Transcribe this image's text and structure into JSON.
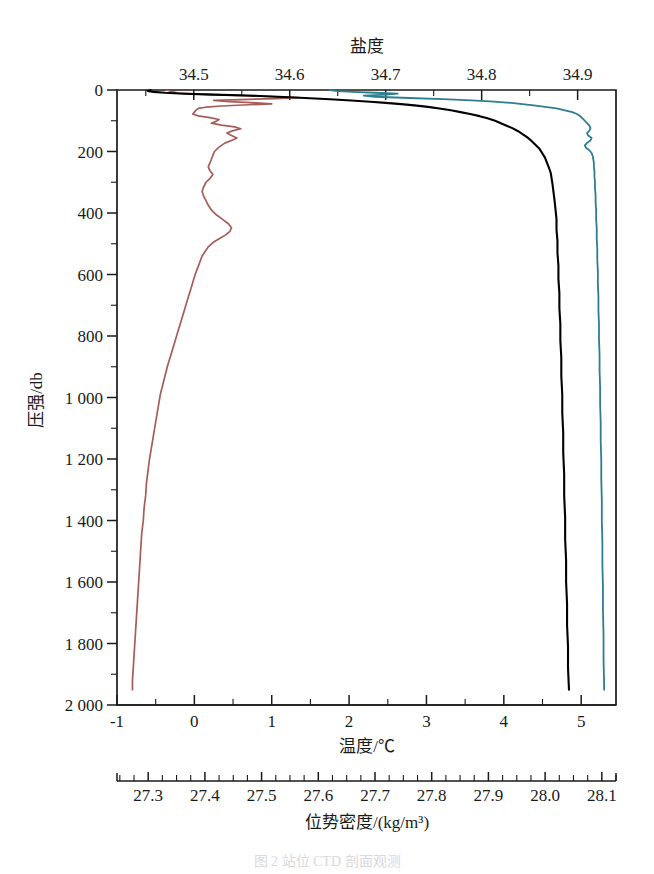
{
  "figure": {
    "caption": "图 2 站位 CTD 剖面观测",
    "background": "#ffffff"
  },
  "chart_data": {
    "type": "line",
    "title": "",
    "orientation": "vertical-profile",
    "grid": false,
    "legend_position": "none",
    "yaxis": {
      "label": "压强/db",
      "ticks": [
        0,
        200,
        400,
        600,
        800,
        1000,
        1200,
        1400,
        1600,
        1800,
        2000
      ],
      "ticklabels": [
        "0",
        "200",
        "400",
        "600",
        "800",
        "1 000",
        "1 200",
        "1 400",
        "1 600",
        "1 800",
        "2 000"
      ],
      "minor_step": 100,
      "range": [
        0,
        2000
      ],
      "inverted": true
    },
    "axes_x": [
      {
        "name": "salinity",
        "position": "top",
        "label": "盐度",
        "ticks": [
          34.5,
          34.6,
          34.7,
          34.8,
          34.9
        ],
        "ticklabels": [
          "34.5",
          "34.6",
          "34.7",
          "34.8",
          "34.9"
        ],
        "minor_step": 0.05,
        "range": [
          34.42,
          34.94
        ],
        "color": "#000000"
      },
      {
        "name": "temperature",
        "position": "bottom",
        "label": "温度/℃",
        "ticks": [
          -1,
          0,
          1,
          2,
          3,
          4,
          5
        ],
        "ticklabels": [
          "-1",
          "0",
          "1",
          "2",
          "3",
          "4",
          "5"
        ],
        "minor_step": 0.5,
        "range": [
          -1.0,
          5.45
        ],
        "color": "#a65d59"
      },
      {
        "name": "potential_density",
        "position": "below-bottom",
        "label": "位势密度/(kg/m³)",
        "ticks": [
          27.3,
          27.4,
          27.5,
          27.6,
          27.7,
          27.8,
          27.9,
          28.0,
          28.1
        ],
        "ticklabels": [
          "27.3",
          "27.4",
          "27.5",
          "27.6",
          "27.7",
          "27.8",
          "27.9",
          "28.0",
          "28.1"
        ],
        "minor_step": 0.025,
        "range": [
          27.245,
          28.125
        ],
        "color": "#2d7f8f"
      }
    ],
    "series": [
      {
        "name": "温度",
        "axis": "temperature",
        "color": "#a65d59",
        "width": 1.7,
        "unit": "℃",
        "points": [
          [
            -0.35,
            0
          ],
          [
            -0.3,
            5
          ],
          [
            -0.2,
            10
          ],
          [
            0.15,
            14
          ],
          [
            0.6,
            18
          ],
          [
            1.05,
            22
          ],
          [
            1.35,
            25
          ],
          [
            1.05,
            28
          ],
          [
            0.6,
            31
          ],
          [
            0.25,
            34
          ],
          [
            0.45,
            38
          ],
          [
            0.8,
            42
          ],
          [
            1.0,
            45
          ],
          [
            0.7,
            48
          ],
          [
            0.35,
            52
          ],
          [
            0.15,
            56
          ],
          [
            0.05,
            60
          ],
          [
            0.02,
            66
          ],
          [
            0.0,
            72
          ],
          [
            -0.02,
            78
          ],
          [
            0.05,
            84
          ],
          [
            0.2,
            90
          ],
          [
            0.32,
            96
          ],
          [
            0.28,
            102
          ],
          [
            0.22,
            108
          ],
          [
            0.35,
            114
          ],
          [
            0.52,
            120
          ],
          [
            0.6,
            126
          ],
          [
            0.5,
            132
          ],
          [
            0.42,
            140
          ],
          [
            0.48,
            148
          ],
          [
            0.55,
            156
          ],
          [
            0.48,
            164
          ],
          [
            0.4,
            172
          ],
          [
            0.35,
            180
          ],
          [
            0.3,
            190
          ],
          [
            0.26,
            200
          ],
          [
            0.24,
            212
          ],
          [
            0.22,
            225
          ],
          [
            0.2,
            238
          ],
          [
            0.18,
            250
          ],
          [
            0.2,
            262
          ],
          [
            0.24,
            275
          ],
          [
            0.2,
            288
          ],
          [
            0.15,
            300
          ],
          [
            0.12,
            315
          ],
          [
            0.1,
            330
          ],
          [
            0.12,
            345
          ],
          [
            0.15,
            360
          ],
          [
            0.18,
            375
          ],
          [
            0.22,
            390
          ],
          [
            0.28,
            405
          ],
          [
            0.36,
            420
          ],
          [
            0.44,
            435
          ],
          [
            0.48,
            448
          ],
          [
            0.46,
            460
          ],
          [
            0.4,
            472
          ],
          [
            0.32,
            484
          ],
          [
            0.24,
            496
          ],
          [
            0.18,
            510
          ],
          [
            0.14,
            525
          ],
          [
            0.1,
            540
          ],
          [
            0.07,
            560
          ],
          [
            0.04,
            580
          ],
          [
            0.01,
            600
          ],
          [
            -0.02,
            625
          ],
          [
            -0.05,
            650
          ],
          [
            -0.08,
            675
          ],
          [
            -0.11,
            700
          ],
          [
            -0.14,
            725
          ],
          [
            -0.17,
            750
          ],
          [
            -0.2,
            775
          ],
          [
            -0.23,
            800
          ],
          [
            -0.26,
            825
          ],
          [
            -0.29,
            850
          ],
          [
            -0.32,
            875
          ],
          [
            -0.35,
            900
          ],
          [
            -0.38,
            930
          ],
          [
            -0.41,
            960
          ],
          [
            -0.44,
            990
          ],
          [
            -0.46,
            1020
          ],
          [
            -0.48,
            1050
          ],
          [
            -0.5,
            1080
          ],
          [
            -0.52,
            1110
          ],
          [
            -0.54,
            1140
          ],
          [
            -0.56,
            1170
          ],
          [
            -0.58,
            1200
          ],
          [
            -0.6,
            1240
          ],
          [
            -0.62,
            1280
          ],
          [
            -0.63,
            1320
          ],
          [
            -0.65,
            1360
          ],
          [
            -0.66,
            1400
          ],
          [
            -0.68,
            1440
          ],
          [
            -0.69,
            1480
          ],
          [
            -0.7,
            1520
          ],
          [
            -0.71,
            1560
          ],
          [
            -0.72,
            1600
          ],
          [
            -0.73,
            1640
          ],
          [
            -0.74,
            1680
          ],
          [
            -0.75,
            1720
          ],
          [
            -0.76,
            1760
          ],
          [
            -0.77,
            1800
          ],
          [
            -0.78,
            1840
          ],
          [
            -0.79,
            1880
          ],
          [
            -0.8,
            1920
          ],
          [
            -0.8,
            1950
          ]
        ]
      },
      {
        "name": "盐度",
        "axis": "salinity",
        "color": "#000000",
        "width": 2.1,
        "unit": "",
        "points": [
          [
            34.455,
            0
          ],
          [
            34.452,
            3
          ],
          [
            34.458,
            6
          ],
          [
            34.47,
            9
          ],
          [
            34.49,
            12
          ],
          [
            34.52,
            15
          ],
          [
            34.556,
            18
          ],
          [
            34.588,
            22
          ],
          [
            34.616,
            26
          ],
          [
            34.642,
            30
          ],
          [
            34.664,
            34
          ],
          [
            34.684,
            38
          ],
          [
            34.7,
            42
          ],
          [
            34.716,
            46
          ],
          [
            34.73,
            50
          ],
          [
            34.744,
            55
          ],
          [
            34.756,
            60
          ],
          [
            34.768,
            66
          ],
          [
            34.778,
            72
          ],
          [
            34.788,
            78
          ],
          [
            34.798,
            85
          ],
          [
            34.806,
            92
          ],
          [
            34.814,
            100
          ],
          [
            34.82,
            108
          ],
          [
            34.826,
            116
          ],
          [
            34.832,
            124
          ],
          [
            34.838,
            134
          ],
          [
            34.843,
            144
          ],
          [
            34.848,
            155
          ],
          [
            34.852,
            166
          ],
          [
            34.856,
            178
          ],
          [
            34.86,
            190
          ],
          [
            34.863,
            205
          ],
          [
            34.866,
            220
          ],
          [
            34.868,
            236
          ],
          [
            34.87,
            252
          ],
          [
            34.872,
            270
          ],
          [
            34.873,
            290
          ],
          [
            34.874,
            310
          ],
          [
            34.875,
            335
          ],
          [
            34.876,
            360
          ],
          [
            34.877,
            390
          ],
          [
            34.878,
            420
          ],
          [
            34.878,
            455
          ],
          [
            34.879,
            490
          ],
          [
            34.879,
            530
          ],
          [
            34.88,
            570
          ],
          [
            34.88,
            615
          ],
          [
            34.881,
            660
          ],
          [
            34.881,
            710
          ],
          [
            34.882,
            760
          ],
          [
            34.882,
            815
          ],
          [
            34.883,
            870
          ],
          [
            34.883,
            930
          ],
          [
            34.884,
            990
          ],
          [
            34.884,
            1050
          ],
          [
            34.885,
            1115
          ],
          [
            34.885,
            1180
          ],
          [
            34.886,
            1250
          ],
          [
            34.886,
            1320
          ],
          [
            34.887,
            1390
          ],
          [
            34.887,
            1460
          ],
          [
            34.888,
            1530
          ],
          [
            34.888,
            1600
          ],
          [
            34.889,
            1670
          ],
          [
            34.889,
            1740
          ],
          [
            34.89,
            1810
          ],
          [
            34.89,
            1880
          ],
          [
            34.891,
            1950
          ]
        ]
      },
      {
        "name": "位势密度",
        "axis": "potential_density",
        "color": "#2d7f8f",
        "width": 1.8,
        "unit": "kg/m³",
        "points": [
          [
            27.62,
            0
          ],
          [
            27.63,
            3
          ],
          [
            27.66,
            6
          ],
          [
            27.7,
            9
          ],
          [
            27.74,
            12
          ],
          [
            27.72,
            15
          ],
          [
            27.68,
            18
          ],
          [
            27.7,
            22
          ],
          [
            27.76,
            26
          ],
          [
            27.82,
            30
          ],
          [
            27.87,
            34
          ],
          [
            27.91,
            38
          ],
          [
            27.94,
            42
          ],
          [
            27.96,
            46
          ],
          [
            27.98,
            50
          ],
          [
            28.0,
            55
          ],
          [
            28.02,
            60
          ],
          [
            28.035,
            66
          ],
          [
            28.048,
            72
          ],
          [
            28.056,
            78
          ],
          [
            28.062,
            85
          ],
          [
            28.066,
            92
          ],
          [
            28.07,
            100
          ],
          [
            28.074,
            108
          ],
          [
            28.078,
            116
          ],
          [
            28.08,
            124
          ],
          [
            28.078,
            132
          ],
          [
            28.074,
            140
          ],
          [
            28.076,
            148
          ],
          [
            28.082,
            156
          ],
          [
            28.08,
            164
          ],
          [
            28.074,
            172
          ],
          [
            28.07,
            180
          ],
          [
            28.072,
            188
          ],
          [
            28.078,
            196
          ],
          [
            28.082,
            205
          ],
          [
            28.084,
            215
          ],
          [
            28.085,
            226
          ],
          [
            28.086,
            238
          ],
          [
            28.086,
            250
          ],
          [
            28.087,
            265
          ],
          [
            28.087,
            282
          ],
          [
            28.088,
            300
          ],
          [
            28.088,
            320
          ],
          [
            28.089,
            342
          ],
          [
            28.089,
            366
          ],
          [
            28.09,
            392
          ],
          [
            28.09,
            420
          ],
          [
            28.091,
            450
          ],
          [
            28.091,
            482
          ],
          [
            28.092,
            516
          ],
          [
            28.092,
            552
          ],
          [
            28.093,
            590
          ],
          [
            28.093,
            630
          ],
          [
            28.094,
            672
          ],
          [
            28.094,
            716
          ],
          [
            28.095,
            762
          ],
          [
            28.095,
            810
          ],
          [
            28.096,
            860
          ],
          [
            28.096,
            912
          ],
          [
            28.097,
            966
          ],
          [
            28.097,
            1022
          ],
          [
            28.098,
            1080
          ],
          [
            28.098,
            1140
          ],
          [
            28.099,
            1202
          ],
          [
            28.099,
            1266
          ],
          [
            28.1,
            1332
          ],
          [
            28.1,
            1400
          ],
          [
            28.101,
            1470
          ],
          [
            28.101,
            1542
          ],
          [
            28.102,
            1616
          ],
          [
            28.102,
            1692
          ],
          [
            28.103,
            1770
          ],
          [
            28.103,
            1850
          ],
          [
            28.104,
            1930
          ],
          [
            28.104,
            1950
          ]
        ]
      }
    ]
  }
}
